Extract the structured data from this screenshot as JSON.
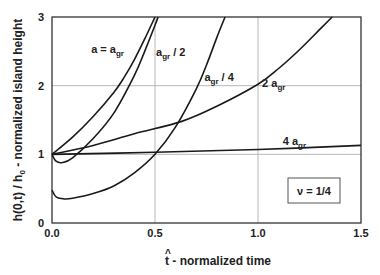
{
  "chart_data": {
    "type": "line",
    "title": "",
    "xlabel": "t̂ - normalized time",
    "xlabel_hat_char": "^",
    "xlabel_t": "t",
    "xlabel_rest": " - normalized time",
    "ylabel": "h(0,t) / h0 - normalized island height",
    "ylabel_parts": {
      "main": "h(0,t) / h",
      "sub": "0",
      "rest": " - normalized island height"
    },
    "xlim": [
      0,
      1.5
    ],
    "ylim": [
      0,
      3
    ],
    "x_ticks": [
      0.0,
      0.5,
      1.0,
      1.5
    ],
    "x_tick_labels": [
      "0.0",
      "0.5",
      "1.0",
      "1.5"
    ],
    "y_ticks": [
      0,
      1,
      2,
      3
    ],
    "y_tick_labels": [
      "0",
      "1",
      "2",
      "3"
    ],
    "grid": true,
    "annotation": "ν = 1/4",
    "series": [
      {
        "name": "a = a_gr",
        "label_main": "a = a",
        "label_sub": "gr",
        "label_rest": "",
        "x": [
          0.0,
          0.1,
          0.2,
          0.3,
          0.35,
          0.4,
          0.45,
          0.5
        ],
        "y": [
          1.0,
          1.25,
          1.55,
          1.9,
          2.12,
          2.38,
          2.68,
          3.0
        ]
      },
      {
        "name": "a_gr / 2",
        "label_main": "a",
        "label_sub": "gr",
        "label_rest": " / 2",
        "x": [
          0.0,
          0.02,
          0.05,
          0.1,
          0.2,
          0.3,
          0.4,
          0.45,
          0.5,
          0.515
        ],
        "y": [
          1.0,
          0.9,
          0.88,
          0.95,
          1.23,
          1.6,
          2.15,
          2.5,
          2.88,
          3.0
        ]
      },
      {
        "name": "a_gr / 4",
        "label_main": "a",
        "label_sub": "gr",
        "label_rest": " / 4",
        "x": [
          0.0,
          0.02,
          0.06,
          0.1,
          0.2,
          0.3,
          0.4,
          0.5,
          0.6,
          0.7,
          0.75,
          0.8,
          0.84
        ],
        "y": [
          0.48,
          0.38,
          0.35,
          0.36,
          0.43,
          0.54,
          0.73,
          1.0,
          1.4,
          1.95,
          2.3,
          2.7,
          3.0
        ]
      },
      {
        "name": "2 a_gr",
        "label_main": "2 a",
        "label_sub": "gr",
        "label_rest": "",
        "x": [
          0.0,
          0.2,
          0.4,
          0.63,
          0.8,
          1.0,
          1.1,
          1.2,
          1.3,
          1.36
        ],
        "y": [
          1.0,
          1.13,
          1.3,
          1.48,
          1.7,
          2.02,
          2.25,
          2.52,
          2.82,
          3.0
        ]
      },
      {
        "name": "4 a_gr",
        "label_main": "4 a",
        "label_sub": "gr",
        "label_rest": "",
        "x": [
          0.0,
          0.5,
          1.0,
          1.5
        ],
        "y": [
          1.0,
          1.03,
          1.07,
          1.13
        ]
      }
    ],
    "label_positions": [
      {
        "x": 0.19,
        "y": 2.48
      },
      {
        "x": 0.505,
        "y": 2.43
      },
      {
        "x": 0.74,
        "y": 2.07
      },
      {
        "x": 1.02,
        "y": 1.98
      },
      {
        "x": 1.12,
        "y": 1.14
      }
    ]
  }
}
